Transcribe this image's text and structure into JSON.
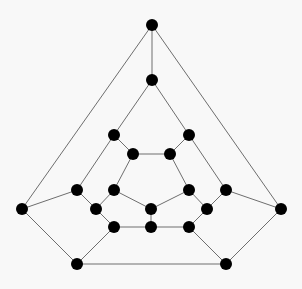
{
  "diagram": {
    "type": "graph",
    "name": "dodecahedral-graph",
    "background": "#f8f8f8",
    "node_color": "#000000",
    "edge_color": "#6e6e6e",
    "node_radius": 6,
    "nodes": [
      {
        "id": 0,
        "x": 152,
        "y": 25
      },
      {
        "id": 1,
        "x": 152,
        "y": 80
      },
      {
        "id": 2,
        "x": 114,
        "y": 135
      },
      {
        "id": 3,
        "x": 189,
        "y": 135
      },
      {
        "id": 4,
        "x": 133,
        "y": 154
      },
      {
        "id": 5,
        "x": 170,
        "y": 154
      },
      {
        "id": 6,
        "x": 77,
        "y": 190
      },
      {
        "id": 7,
        "x": 114,
        "y": 190
      },
      {
        "id": 8,
        "x": 189,
        "y": 190
      },
      {
        "id": 9,
        "x": 226,
        "y": 190
      },
      {
        "id": 10,
        "x": 22,
        "y": 209
      },
      {
        "id": 11,
        "x": 96,
        "y": 209
      },
      {
        "id": 12,
        "x": 151,
        "y": 209
      },
      {
        "id": 13,
        "x": 207,
        "y": 209
      },
      {
        "id": 14,
        "x": 281,
        "y": 209
      },
      {
        "id": 15,
        "x": 114,
        "y": 227
      },
      {
        "id": 16,
        "x": 151,
        "y": 227
      },
      {
        "id": 17,
        "x": 189,
        "y": 227
      },
      {
        "id": 18,
        "x": 77,
        "y": 264
      },
      {
        "id": 19,
        "x": 226,
        "y": 264
      }
    ],
    "edges": [
      [
        0,
        1
      ],
      [
        0,
        10
      ],
      [
        0,
        14
      ],
      [
        1,
        2
      ],
      [
        1,
        3
      ],
      [
        2,
        4
      ],
      [
        2,
        6
      ],
      [
        3,
        5
      ],
      [
        3,
        9
      ],
      [
        4,
        5
      ],
      [
        4,
        7
      ],
      [
        5,
        8
      ],
      [
        10,
        6
      ],
      [
        10,
        18
      ],
      [
        14,
        9
      ],
      [
        14,
        19
      ],
      [
        6,
        11
      ],
      [
        7,
        11
      ],
      [
        7,
        12
      ],
      [
        8,
        12
      ],
      [
        8,
        13
      ],
      [
        9,
        13
      ],
      [
        11,
        15
      ],
      [
        13,
        17
      ],
      [
        12,
        16
      ],
      [
        15,
        16
      ],
      [
        16,
        17
      ],
      [
        15,
        18
      ],
      [
        17,
        19
      ],
      [
        18,
        19
      ]
    ]
  }
}
